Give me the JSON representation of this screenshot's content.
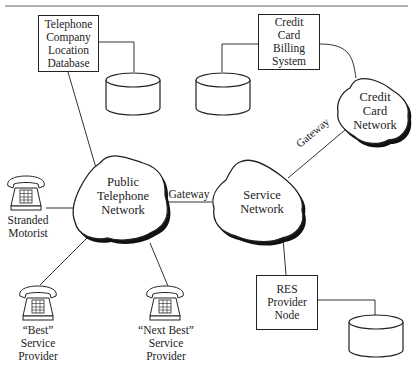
{
  "diagram": {
    "nodes": {
      "location_db": {
        "lines": [
          "Telephone",
          "Company",
          "Location",
          "Database"
        ]
      },
      "billing": {
        "lines": [
          "Credit",
          "Card",
          "Billing",
          "System"
        ]
      },
      "credit_net": {
        "lines": [
          "Credit",
          "Card",
          "Network"
        ]
      },
      "ptn": {
        "lines": [
          "Public",
          "Telephone",
          "Network"
        ]
      },
      "service_net": {
        "lines": [
          "Service",
          "Network"
        ]
      },
      "res_node": {
        "lines": [
          "RES",
          "Provider",
          "Node"
        ]
      },
      "stranded": {
        "lines": [
          "Stranded",
          "Motorist"
        ]
      },
      "best": {
        "lines": [
          "“Best”",
          "Service",
          "Provider"
        ]
      },
      "next_best": {
        "lines": [
          "“Next Best”",
          "Service",
          "Provider"
        ]
      }
    },
    "edge_labels": {
      "gateway_ptn_service": "Gateway",
      "gateway_service_credit": "Gateway"
    },
    "colors": {
      "line": "#222222",
      "shadow": "#111111",
      "rule": "#888888"
    }
  }
}
